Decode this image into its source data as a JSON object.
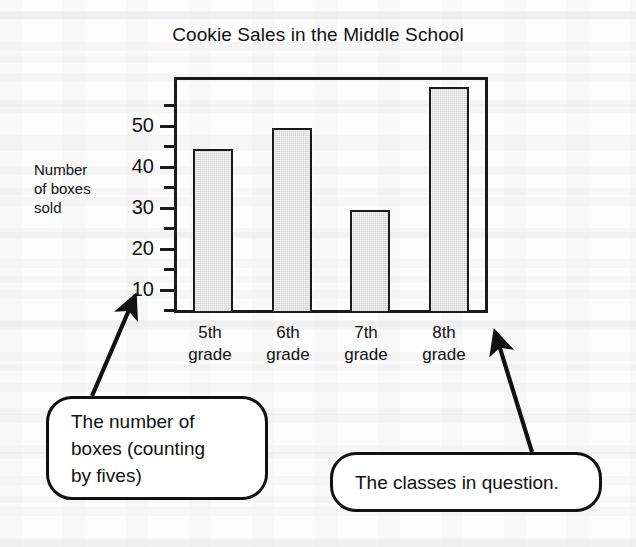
{
  "chart_data": {
    "type": "bar",
    "title": "Cookie Sales in the Middle School",
    "xlabel": "",
    "ylabel": "Number of boxes sold",
    "categories": [
      "5th grade",
      "6th grade",
      "7th grade",
      "8th grade"
    ],
    "values": [
      40,
      45,
      25,
      55
    ],
    "ylim": [
      0,
      57.5
    ],
    "ytick_interval": 5,
    "ytick_labels": [
      "50",
      "40",
      "30",
      "20",
      "10"
    ],
    "ytick_label_values": [
      50,
      40,
      30,
      20,
      10
    ],
    "yticks_minor_values": [
      55,
      45,
      35,
      25,
      15,
      5
    ],
    "grid": false,
    "legend": false,
    "bar_fill_color": "#d2d2d2",
    "bar_edge_color": "#1a1a1a",
    "frame_color": "#1a1a1a"
  },
  "title": {
    "text": "Cookie Sales in the Middle School"
  },
  "y_axis": {
    "label_lines": [
      "Number",
      "of boxes",
      "sold"
    ],
    "tick_labels": [
      "50",
      "40",
      "30",
      "20",
      "10"
    ]
  },
  "x_axis": {
    "categories": [
      {
        "line1": "5th",
        "line2": "grade"
      },
      {
        "line1": "6th",
        "line2": "grade"
      },
      {
        "line1": "7th",
        "line2": "grade"
      },
      {
        "line1": "8th",
        "line2": "grade"
      }
    ]
  },
  "callouts": {
    "left": {
      "lines": [
        "The number of",
        "boxes (counting",
        "by fives)"
      ]
    },
    "right": {
      "lines": [
        "The classes in question."
      ]
    }
  }
}
